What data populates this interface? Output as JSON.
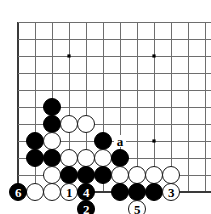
{
  "board": {
    "title": "go-board-diagram",
    "geometry": {
      "origin_x": 18,
      "origin_y": 22,
      "spacing": 17,
      "cols": 12,
      "rows": 11,
      "stone_diameter": 18
    },
    "colors": {
      "background": "#ffffff",
      "grid_line": "#6e6e6e",
      "edge_line": "#3a3a3a",
      "black_stone": "#000000",
      "white_stone": "#ffffff",
      "stone_outline": "#1a1a1a",
      "star_point": "#000000",
      "label_text": "#000000"
    },
    "star_points": [
      {
        "col": 3,
        "row": 2
      },
      {
        "col": 8,
        "row": 2
      },
      {
        "col": 8,
        "row": 7
      }
    ],
    "stones": [
      {
        "id": "b-c2r5",
        "color": "black",
        "col": 2,
        "row": 5,
        "label": ""
      },
      {
        "id": "b-c2r6",
        "color": "black",
        "col": 2,
        "row": 6,
        "label": ""
      },
      {
        "id": "w-c3r6",
        "color": "white",
        "col": 3,
        "row": 6,
        "label": ""
      },
      {
        "id": "w-c4r6",
        "color": "white",
        "col": 4,
        "row": 6,
        "label": ""
      },
      {
        "id": "b-c1r7",
        "color": "black",
        "col": 1,
        "row": 7,
        "label": ""
      },
      {
        "id": "w-c2r7",
        "color": "white",
        "col": 2,
        "row": 7,
        "label": ""
      },
      {
        "id": "b-c5r7",
        "color": "black",
        "col": 5,
        "row": 7,
        "label": ""
      },
      {
        "id": "b-c1r8",
        "color": "black",
        "col": 1,
        "row": 8,
        "label": ""
      },
      {
        "id": "b-c2r8",
        "color": "black",
        "col": 2,
        "row": 8,
        "label": ""
      },
      {
        "id": "w-c3r8",
        "color": "white",
        "col": 3,
        "row": 8,
        "label": ""
      },
      {
        "id": "w-c4r8",
        "color": "white",
        "col": 4,
        "row": 8,
        "label": ""
      },
      {
        "id": "w-c5r8",
        "color": "white",
        "col": 5,
        "row": 8,
        "label": ""
      },
      {
        "id": "b-c6r8",
        "color": "black",
        "col": 6,
        "row": 8,
        "label": ""
      },
      {
        "id": "w-c2r9",
        "color": "white",
        "col": 2,
        "row": 9,
        "label": ""
      },
      {
        "id": "b-c3r9",
        "color": "black",
        "col": 3,
        "row": 9,
        "label": ""
      },
      {
        "id": "b-c4r9",
        "color": "black",
        "col": 4,
        "row": 9,
        "label": ""
      },
      {
        "id": "b-c5r9",
        "color": "black",
        "col": 5,
        "row": 9,
        "label": ""
      },
      {
        "id": "w-c6r9",
        "color": "white",
        "col": 6,
        "row": 9,
        "label": ""
      },
      {
        "id": "w-c7r9",
        "color": "white",
        "col": 7,
        "row": 9,
        "label": ""
      },
      {
        "id": "w-c8r9",
        "color": "white",
        "col": 8,
        "row": 9,
        "label": ""
      },
      {
        "id": "w-c9r9",
        "color": "white",
        "col": 9,
        "row": 9,
        "label": ""
      },
      {
        "id": "b-c0r10",
        "color": "black",
        "col": 0,
        "row": 10,
        "label": "6"
      },
      {
        "id": "w-c1r10",
        "color": "white",
        "col": 1,
        "row": 10,
        "label": ""
      },
      {
        "id": "w-c2r10",
        "color": "white",
        "col": 2,
        "row": 10,
        "label": ""
      },
      {
        "id": "w-c3r10",
        "color": "white",
        "col": 3,
        "row": 10,
        "label": "1"
      },
      {
        "id": "b-c4r10",
        "color": "black",
        "col": 4,
        "row": 10,
        "label": "4"
      },
      {
        "id": "b-c6r10",
        "color": "black",
        "col": 6,
        "row": 10,
        "label": ""
      },
      {
        "id": "b-c7r10",
        "color": "black",
        "col": 7,
        "row": 10,
        "label": ""
      },
      {
        "id": "b-c8r10",
        "color": "black",
        "col": 8,
        "row": 10,
        "label": ""
      },
      {
        "id": "w-c9r10",
        "color": "white",
        "col": 9,
        "row": 10,
        "label": "3"
      },
      {
        "id": "b-c4r11",
        "color": "black",
        "col": 4,
        "row": 11,
        "label": "2"
      },
      {
        "id": "w-c7r11",
        "color": "white",
        "col": 7,
        "row": 11,
        "label": "5"
      }
    ],
    "markers": [
      {
        "id": "mark-a",
        "col": 6,
        "row": 7,
        "label": "a"
      }
    ],
    "move_order": [
      "1",
      "2",
      "3",
      "4",
      "5",
      "6"
    ]
  }
}
